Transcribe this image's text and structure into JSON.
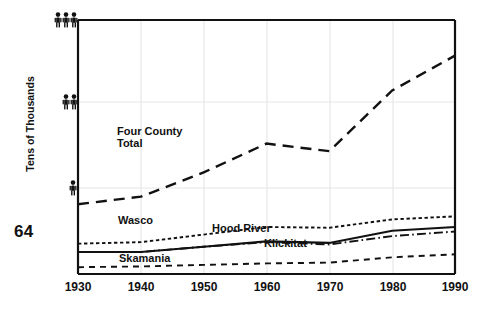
{
  "page": {
    "page_number": "64"
  },
  "chart_data": {
    "type": "line",
    "title": "",
    "xlabel": "",
    "ylabel": "Tens of Thousands",
    "x": [
      1930,
      1940,
      1950,
      1960,
      1970,
      1980,
      1990
    ],
    "xtick_labels": [
      "1930",
      "1940",
      "1950",
      "1960",
      "1970",
      "1980",
      "1990"
    ],
    "xlim": [
      1930,
      1990
    ],
    "ylim": [
      0,
      3.35
    ],
    "ytick_values": [
      1,
      2,
      3
    ],
    "ytick_labels": [
      "person-icon-1",
      "person-icon-2",
      "person-icon-3"
    ],
    "ytick_glyph": "person",
    "grid": "faint vertical gridlines at each decade; faint horizontal gridlines at person ticks",
    "legend": "inline labels on plot",
    "series": [
      {
        "name": "Four County Total",
        "label": "Four County Total",
        "label_lines": [
          "Four County",
          "Total"
        ],
        "style": "dashed",
        "values": [
          0.92,
          1.02,
          1.34,
          1.72,
          1.62,
          2.42,
          2.88
        ]
      },
      {
        "name": "Wasco",
        "label": "Wasco",
        "style": "dotted",
        "values": [
          0.4,
          0.42,
          0.52,
          0.62,
          0.61,
          0.72,
          0.76
        ]
      },
      {
        "name": "Hood River",
        "label": "Hood River",
        "style": "solid",
        "values": [
          0.29,
          0.29,
          0.36,
          0.43,
          0.41,
          0.57,
          0.62
        ]
      },
      {
        "name": "Klickitat",
        "label": "Klickitat",
        "style": "dash-dot",
        "values": [
          0.29,
          0.29,
          0.36,
          0.42,
          0.39,
          0.5,
          0.56
        ]
      },
      {
        "name": "Skamania",
        "label": "Skamania",
        "style": "dashed-small",
        "values": [
          0.09,
          0.1,
          0.12,
          0.14,
          0.15,
          0.22,
          0.26
        ]
      }
    ]
  },
  "colors": {
    "ink": "#111111",
    "grid": "#dddddd",
    "background": "#ffffff"
  }
}
